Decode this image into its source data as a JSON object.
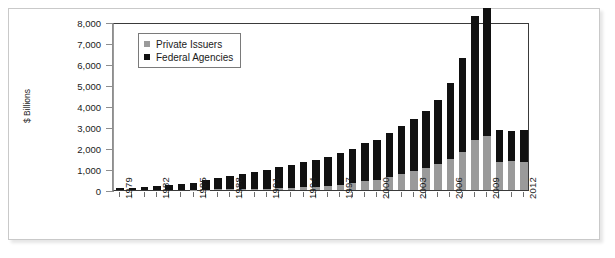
{
  "chart_data": {
    "type": "bar",
    "subtype": "stacked-vertical",
    "title": "",
    "xlabel": "",
    "ylabel": "$ Billions",
    "ylim": [
      0,
      8000
    ],
    "ytick_step": 1000,
    "ytick_labels": [
      "8,000",
      "7,000",
      "6,000",
      "5,000",
      "4,000",
      "3,000",
      "2,000",
      "1,000",
      "0"
    ],
    "ytick_values": [
      8000,
      7000,
      6000,
      5000,
      4000,
      3000,
      2000,
      1000,
      0
    ],
    "grid": false,
    "legend_position": "top-left-inside",
    "categories": [
      "1979",
      "1980",
      "1981",
      "1982",
      "1983",
      "1984",
      "1985",
      "1986",
      "1987",
      "1988",
      "1989",
      "1990",
      "1991",
      "1992",
      "1993",
      "1994",
      "1995",
      "1996",
      "1997",
      "1998",
      "1999",
      "2000",
      "2001",
      "2002",
      "2003",
      "2004",
      "2005",
      "2006",
      "2007",
      "2008",
      "2009",
      "2010",
      "2011",
      "2012"
    ],
    "xtick_labels": [
      "1979",
      "1982",
      "1985",
      "1988",
      "1991",
      "1994",
      "1997",
      "2000",
      "2003",
      "2006",
      "2009",
      "2012"
    ],
    "series": [
      {
        "name": "Federal Agencies",
        "color": "#111111",
        "values": [
          90,
          110,
          130,
          180,
          230,
          270,
          340,
          480,
          560,
          640,
          710,
          790,
          900,
          1000,
          1100,
          1200,
          1280,
          1400,
          1500,
          1620,
          1800,
          1900,
          2100,
          2300,
          2500,
          2700,
          3050,
          3600,
          4500,
          5900,
          6100,
          1500,
          1400,
          1500
        ]
      },
      {
        "name": "Private Issuers",
        "color": "#9a9a9a",
        "values": [
          0,
          0,
          0,
          0,
          0,
          0,
          10,
          20,
          30,
          40,
          50,
          60,
          70,
          90,
          110,
          130,
          150,
          180,
          250,
          330,
          420,
          500,
          620,
          760,
          900,
          1050,
          1250,
          1500,
          1800,
          2400,
          2550,
          1350,
          1400,
          1350
        ]
      }
    ],
    "totals": [
      90,
      110,
      130,
      180,
      230,
      270,
      350,
      500,
      590,
      680,
      760,
      850,
      970,
      1090,
      1210,
      1330,
      1430,
      1580,
      1750,
      1950,
      2220,
      2400,
      2720,
      3060,
      3400,
      3750,
      4300,
      5100,
      6300,
      8300,
      8650,
      2850,
      2800,
      2850
    ],
    "annotations": []
  },
  "legend": {
    "items": [
      {
        "label": "Private Issuers",
        "color": "#9a9a9a",
        "swatch": "legend-swatch-private"
      },
      {
        "label": "Federal Agencies",
        "color": "#111111",
        "swatch": "legend-swatch-federal"
      }
    ]
  },
  "axis": {
    "y_title": "$ Billions"
  }
}
